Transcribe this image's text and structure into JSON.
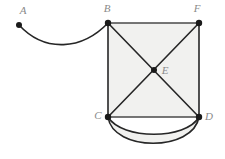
{
  "figure": {
    "background_color": "#ffffff",
    "face_fill_color": "#f1f1ef",
    "edge_color": "#262626",
    "label_color": "#8a8a8a",
    "vertex_color": "#1a1a1a",
    "width": 225,
    "height": 159
  },
  "vertices": [
    {
      "id": "A",
      "label": "A",
      "cx": 19,
      "cy": 25,
      "lx": 23,
      "ly": 11,
      "r": 3.0
    },
    {
      "id": "B",
      "label": "B",
      "cx": 108,
      "cy": 23,
      "lx": 107,
      "ly": 9,
      "r": 3.2
    },
    {
      "id": "F",
      "label": "F",
      "cx": 199,
      "cy": 23,
      "lx": 197,
      "ly": 9,
      "r": 3.2
    },
    {
      "id": "E",
      "label": "E",
      "cx": 154,
      "cy": 70,
      "lx": 165,
      "ly": 71,
      "r": 3.0
    },
    {
      "id": "C",
      "label": "C",
      "cx": 108,
      "cy": 117,
      "lx": 98,
      "ly": 116,
      "r": 3.2
    },
    {
      "id": "D",
      "label": "D",
      "cx": 199,
      "cy": 117,
      "lx": 209,
      "ly": 117,
      "r": 3.2
    }
  ],
  "edges": [
    {
      "id": "AB",
      "from": "A",
      "to": "B",
      "kind": "curve",
      "label": "A to B curved edge",
      "path": "M 19 25 C 45 53, 82 50, 108 23"
    },
    {
      "id": "BF",
      "from": "B",
      "to": "F",
      "kind": "straight",
      "label": "B to F top edge",
      "path": "M 108 23 L 199 23"
    },
    {
      "id": "BC",
      "from": "B",
      "to": "C",
      "kind": "straight",
      "label": "B to C left edge",
      "path": "M 108 23 L 108 117"
    },
    {
      "id": "FD",
      "from": "F",
      "to": "D",
      "kind": "straight",
      "label": "F to D right edge",
      "path": "M 199 23 L 199 117"
    },
    {
      "id": "CD",
      "from": "C",
      "to": "D",
      "kind": "straight",
      "label": "C to D bottom edge",
      "path": "M 108 117 L 199 117"
    },
    {
      "id": "BD",
      "from": "B",
      "to": "D",
      "kind": "straight",
      "label": "B to D diagonal through E",
      "path": "M 108 23 L 199 117"
    },
    {
      "id": "FC",
      "from": "F",
      "to": "C",
      "kind": "straight",
      "label": "F to C diagonal through E",
      "path": "M 199 23 L 108 117"
    },
    {
      "id": "CD_arc_inner",
      "from": "C",
      "to": "D",
      "kind": "arc",
      "label": "C to D inner arc",
      "path": "M 108 117 C 122 140, 186 140, 199 117"
    },
    {
      "id": "CD_arc_outer",
      "from": "C",
      "to": "D",
      "kind": "arc",
      "label": "C to D outer arc",
      "path": "M 108 117 C 113 152, 193 152, 199 117"
    }
  ],
  "faces": [
    {
      "id": "square-BFDC",
      "label": "square face B F D C",
      "path": "M 108 23 L 199 23 L 199 117 L 108 117 Z"
    },
    {
      "id": "lens-CD",
      "label": "lens face between the two C-D arcs",
      "path": "M 108 117 C 122 140, 186 140, 199 117 C 193 152, 113 152, 108 117 Z"
    }
  ]
}
